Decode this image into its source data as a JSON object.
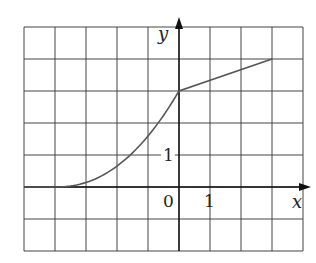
{
  "chart_data": {
    "type": "line",
    "title": "",
    "xlabel": "x",
    "ylabel": "y",
    "xlim": [
      -5,
      4
    ],
    "ylim": [
      -2,
      5
    ],
    "grid": true,
    "grid_step": 1,
    "tick_labels": {
      "origin": "0",
      "x_one": "1",
      "y_one": "1"
    },
    "series": [
      {
        "name": "f",
        "x": [
          -5,
          -4,
          -3,
          -2,
          -1,
          0,
          3
        ],
        "y": [
          0,
          0,
          0.12,
          0.6,
          1.5,
          3,
          4
        ]
      }
    ],
    "colors": {
      "grid": "#444444",
      "axis": "#111111",
      "curve": "#555555"
    }
  }
}
